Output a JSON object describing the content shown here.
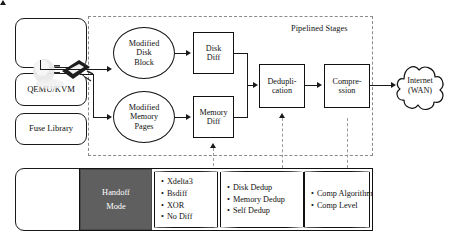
{
  "figure": {
    "type": "block-flow-diagram",
    "region_label": "Pipelined Stages"
  },
  "left_stack": {
    "boxes": [
      {
        "id": "vm-box",
        "label": ""
      },
      {
        "id": "qemu-kvm",
        "label": "QEMU/KVM"
      },
      {
        "id": "fuse-library",
        "label": "Fuse Library"
      },
      {
        "id": "lower-empty-box",
        "label": ""
      }
    ]
  },
  "sources": [
    {
      "id": "modified-disk-block",
      "lines": [
        "Modified",
        "Disk",
        "Block"
      ]
    },
    {
      "id": "modified-memory-pages",
      "lines": [
        "Modified",
        "Memory",
        "Pages"
      ]
    }
  ],
  "stages": [
    {
      "id": "disk-diff",
      "lines": [
        "Disk",
        "Diff"
      ]
    },
    {
      "id": "memory-diff",
      "lines": [
        "Memory",
        "Diff"
      ]
    },
    {
      "id": "deduplication",
      "lines": [
        "Dedupli-",
        "cation"
      ]
    },
    {
      "id": "compression",
      "lines": [
        "Compre-",
        "ssion"
      ]
    }
  ],
  "sink": {
    "id": "internet-wan",
    "lines": [
      "Internet",
      "(WAN)"
    ]
  },
  "handoff": {
    "id": "handoff-mode",
    "lines": [
      "Handoff",
      "Mode"
    ],
    "fill_color": "#5f5f5f",
    "text_color": "#ffffff"
  },
  "option_groups": [
    {
      "id": "diff-algorithms",
      "items": [
        "Xdelta3",
        "Bsdiff",
        "XOR",
        "No Diff"
      ]
    },
    {
      "id": "dedup-options",
      "items": [
        "Disk Dedup",
        "Memory Dedup",
        "Self Dedup"
      ]
    },
    {
      "id": "compression-options",
      "items": [
        "Comp Algorithm",
        "Comp Level"
      ]
    }
  ],
  "colors": {
    "stroke": "#111111",
    "dashed": "#8a8a8a",
    "handoff_fill": "#5f5f5f",
    "background": "#ffffff"
  }
}
